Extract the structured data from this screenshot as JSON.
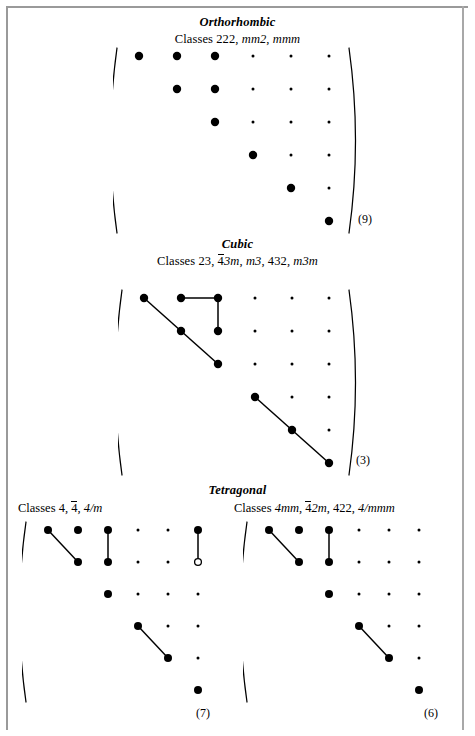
{
  "page": {
    "background": "#ffffff",
    "ink": "#000000",
    "frame_color": "#9a9a9a",
    "width": 475,
    "height": 736
  },
  "legend": {
    "filled_dot": "nonzero-component",
    "small_dot": "zero-component",
    "open_circle": "negative-of-linked-component",
    "connector_line": "equal-components"
  },
  "sections": [
    {
      "id": "orthorhombic",
      "title": "Orthorhombic",
      "classes_prefix": "Classes ",
      "classes_parts": [
        {
          "text": "222",
          "italic": false,
          "overbar": false
        },
        {
          "text": ", ",
          "italic": false,
          "overbar": false
        },
        {
          "text": "mm2",
          "italic": true,
          "overbar": false
        },
        {
          "text": ", ",
          "italic": false,
          "overbar": false
        },
        {
          "text": "mmm",
          "italic": true,
          "overbar": false
        }
      ],
      "classes_text": "Classes 222, mm2, mmm",
      "count": "(9)",
      "matrix": {
        "rows": 6,
        "cols": 6,
        "big_dots": [
          [
            1,
            1
          ],
          [
            1,
            2
          ],
          [
            1,
            3
          ],
          [
            2,
            2
          ],
          [
            2,
            3
          ],
          [
            3,
            3
          ],
          [
            4,
            4
          ],
          [
            5,
            5
          ],
          [
            6,
            6
          ]
        ],
        "small_dots": [
          [
            1,
            4
          ],
          [
            1,
            5
          ],
          [
            1,
            6
          ],
          [
            2,
            4
          ],
          [
            2,
            5
          ],
          [
            2,
            6
          ],
          [
            3,
            4
          ],
          [
            3,
            5
          ],
          [
            3,
            6
          ],
          [
            4,
            5
          ],
          [
            4,
            6
          ],
          [
            5,
            6
          ]
        ],
        "open_dots": [],
        "links": []
      }
    },
    {
      "id": "cubic",
      "title": "Cubic",
      "classes_prefix": "Classes ",
      "classes_parts": [
        {
          "text": "23",
          "italic": false,
          "overbar": false
        },
        {
          "text": ", ",
          "italic": false,
          "overbar": false
        },
        {
          "text": "4",
          "italic": false,
          "overbar": true
        },
        {
          "text": "3m",
          "italic": true,
          "overbar": false
        },
        {
          "text": ", ",
          "italic": false,
          "overbar": false
        },
        {
          "text": "m3",
          "italic": true,
          "overbar": false
        },
        {
          "text": ", ",
          "italic": false,
          "overbar": false
        },
        {
          "text": "432",
          "italic": false,
          "overbar": false
        },
        {
          "text": ", ",
          "italic": false,
          "overbar": false
        },
        {
          "text": "m3m",
          "italic": true,
          "overbar": false
        }
      ],
      "classes_text": "Classes 23, 4̅3m, m3, 432, m3m",
      "count": "(3)",
      "matrix": {
        "rows": 6,
        "cols": 6,
        "big_dots": [
          [
            1,
            1
          ],
          [
            1,
            2
          ],
          [
            1,
            3
          ],
          [
            2,
            2
          ],
          [
            2,
            3
          ],
          [
            3,
            3
          ],
          [
            4,
            4
          ],
          [
            5,
            5
          ],
          [
            6,
            6
          ]
        ],
        "small_dots": [
          [
            1,
            4
          ],
          [
            1,
            5
          ],
          [
            1,
            6
          ],
          [
            2,
            4
          ],
          [
            2,
            5
          ],
          [
            2,
            6
          ],
          [
            3,
            4
          ],
          [
            3,
            5
          ],
          [
            3,
            6
          ],
          [
            4,
            5
          ],
          [
            4,
            6
          ],
          [
            5,
            6
          ]
        ],
        "open_dots": [],
        "links": [
          {
            "from": [
              1,
              1
            ],
            "to": [
              2,
              2
            ]
          },
          {
            "from": [
              2,
              2
            ],
            "to": [
              3,
              3
            ]
          },
          {
            "from": [
              1,
              2
            ],
            "to": [
              1,
              3
            ]
          },
          {
            "from": [
              1,
              3
            ],
            "to": [
              2,
              3
            ]
          },
          {
            "from": [
              4,
              4
            ],
            "to": [
              5,
              5
            ]
          },
          {
            "from": [
              5,
              5
            ],
            "to": [
              6,
              6
            ]
          }
        ]
      }
    },
    {
      "id": "tetragonal",
      "title": "Tetragonal",
      "classes_prefix": "Classes ",
      "classes_parts": [],
      "classes_text": "",
      "count": "",
      "matrix": null
    }
  ],
  "tetragonal_left": {
    "id": "tetragonal-4-4bar-4m",
    "classes_prefix": "Classes ",
    "classes_parts": [
      {
        "text": "4",
        "italic": false,
        "overbar": false
      },
      {
        "text": ", ",
        "italic": false,
        "overbar": false
      },
      {
        "text": "4",
        "italic": false,
        "overbar": true
      },
      {
        "text": ", ",
        "italic": false,
        "overbar": false
      },
      {
        "text": "4/m",
        "italic": true,
        "overbar": false
      }
    ],
    "classes_text": "Classes 4, 4̅, 4/m",
    "count": "(7)",
    "matrix": {
      "rows": 6,
      "cols": 6,
      "big_dots": [
        [
          1,
          1
        ],
        [
          1,
          2
        ],
        [
          1,
          3
        ],
        [
          1,
          6
        ],
        [
          2,
          2
        ],
        [
          2,
          3
        ],
        [
          3,
          3
        ],
        [
          4,
          4
        ],
        [
          5,
          5
        ],
        [
          6,
          6
        ]
      ],
      "small_dots": [
        [
          1,
          4
        ],
        [
          1,
          5
        ],
        [
          2,
          4
        ],
        [
          2,
          5
        ],
        [
          3,
          4
        ],
        [
          3,
          5
        ],
        [
          3,
          6
        ],
        [
          4,
          5
        ],
        [
          4,
          6
        ],
        [
          5,
          6
        ]
      ],
      "open_dots": [
        [
          2,
          6
        ]
      ],
      "links": [
        {
          "from": [
            1,
            1
          ],
          "to": [
            2,
            2
          ]
        },
        {
          "from": [
            1,
            3
          ],
          "to": [
            2,
            3
          ]
        },
        {
          "from": [
            1,
            6
          ],
          "to": [
            2,
            6
          ]
        },
        {
          "from": [
            4,
            4
          ],
          "to": [
            5,
            5
          ]
        }
      ]
    }
  },
  "tetragonal_right": {
    "id": "tetragonal-4mm-4bar2m-422-4mmm",
    "classes_prefix": "Classes ",
    "classes_parts": [
      {
        "text": "4mm",
        "italic": true,
        "overbar": false
      },
      {
        "text": ", ",
        "italic": false,
        "overbar": false
      },
      {
        "text": "4",
        "italic": false,
        "overbar": true
      },
      {
        "text": "2m",
        "italic": true,
        "overbar": false
      },
      {
        "text": ", ",
        "italic": false,
        "overbar": false
      },
      {
        "text": "422",
        "italic": false,
        "overbar": false
      },
      {
        "text": ", ",
        "italic": false,
        "overbar": false
      },
      {
        "text": "4/mmm",
        "italic": true,
        "overbar": false
      }
    ],
    "classes_text": "Classes 4mm, 4̅2m, 422, 4/mmm",
    "count": "(6)",
    "matrix": {
      "rows": 6,
      "cols": 6,
      "big_dots": [
        [
          1,
          1
        ],
        [
          1,
          2
        ],
        [
          1,
          3
        ],
        [
          2,
          2
        ],
        [
          2,
          3
        ],
        [
          3,
          3
        ],
        [
          4,
          4
        ],
        [
          5,
          5
        ],
        [
          6,
          6
        ]
      ],
      "small_dots": [
        [
          1,
          4
        ],
        [
          1,
          5
        ],
        [
          1,
          6
        ],
        [
          2,
          4
        ],
        [
          2,
          5
        ],
        [
          2,
          6
        ],
        [
          3,
          4
        ],
        [
          3,
          5
        ],
        [
          3,
          6
        ],
        [
          4,
          5
        ],
        [
          4,
          6
        ],
        [
          5,
          6
        ]
      ],
      "open_dots": [],
      "links": [
        {
          "from": [
            1,
            1
          ],
          "to": [
            2,
            2
          ]
        },
        {
          "from": [
            1,
            3
          ],
          "to": [
            2,
            3
          ]
        },
        {
          "from": [
            4,
            4
          ],
          "to": [
            5,
            5
          ]
        }
      ]
    }
  },
  "geometry": {
    "orthorhombic": {
      "x": 113,
      "y": 46,
      "cw": 38,
      "rh": 33,
      "dotR": 4.2,
      "smallR": 1.5,
      "w": 245,
      "h": 192
    },
    "cubic": {
      "x": 118,
      "y": 288,
      "cw": 37,
      "rh": 33,
      "dotR": 4.2,
      "smallR": 1.5,
      "w": 243,
      "h": 190
    },
    "tet_left": {
      "x": 22,
      "y": 520,
      "cw": 30,
      "rh": 32,
      "dotR": 4.0,
      "smallR": 1.5,
      "w": 195,
      "h": 184
    },
    "tet_right": {
      "x": 243,
      "y": 520,
      "cw": 30,
      "rh": 32,
      "dotR": 4.0,
      "smallR": 1.5,
      "w": 195,
      "h": 184
    }
  }
}
